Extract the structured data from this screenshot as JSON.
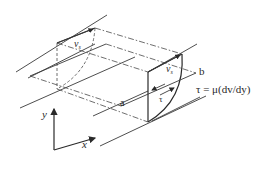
{
  "figure": {
    "labels": {
      "velocity_top_back": "v",
      "velocity_top_back_sub": "s",
      "velocity_top_front": "v",
      "velocity_top_front_sub": "s",
      "side_b": "b",
      "side_a": "a",
      "shear": "τ",
      "equation": "τ = μ(dv/dy)",
      "axis_y": "y",
      "axis_x": "x"
    },
    "colors": {
      "line": "#3a3a3a",
      "text": "#2a2a2a",
      "background": "#ffffff"
    }
  }
}
